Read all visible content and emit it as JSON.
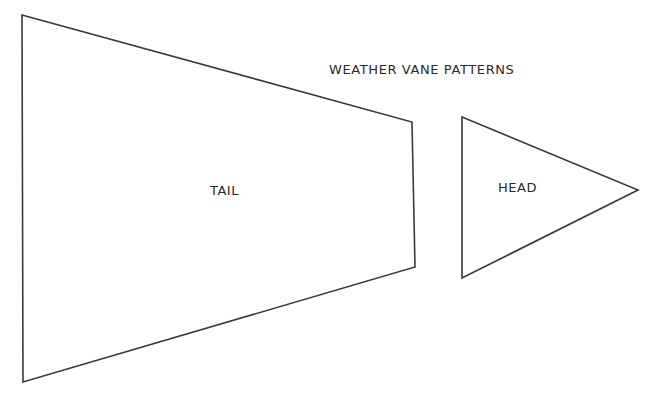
{
  "diagram": {
    "title": "WEATHER VANE PATTERNS",
    "stroke_color": "#3a3a3a",
    "shapes": [
      {
        "id": "tail",
        "kind": "trapezoid",
        "label": "TAIL"
      },
      {
        "id": "head",
        "kind": "triangle",
        "label": "HEAD"
      }
    ]
  }
}
